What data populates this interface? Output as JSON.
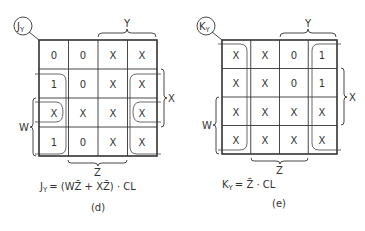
{
  "maps": [
    {
      "id": "d",
      "name_main": "J",
      "name_sub": "Y",
      "caption": "(d)",
      "equation": {
        "lhs_main": "J",
        "lhs_sub": "Y",
        "rhs": "= (WZ̄ + XZ̄) · CL"
      },
      "var_labels": {
        "top": "Y",
        "right": "X",
        "left": "W",
        "bottom": "Z"
      },
      "cells": [
        [
          "0",
          "0",
          "X",
          "X"
        ],
        [
          "1",
          "0",
          "X",
          "X"
        ],
        [
          "X",
          "X",
          "X",
          "X"
        ],
        [
          "1",
          "0",
          "X",
          "X"
        ]
      ],
      "groups": [
        "column 1 rows 2-4 (WZ̄)",
        "column 4 rows 2-4 (XZ̄ wrap)",
        "row 3 cols 1 and 4 (wrap)"
      ]
    },
    {
      "id": "e",
      "name_main": "K",
      "name_sub": "Y",
      "caption": "(e)",
      "equation": {
        "lhs_main": "K",
        "lhs_sub": "Y",
        "rhs": "= Z̄ · CL"
      },
      "var_labels": {
        "top": "Y",
        "right": "X",
        "left": "W",
        "bottom": "Z"
      },
      "cells": [
        [
          "X",
          "X",
          "0",
          "1"
        ],
        [
          "X",
          "X",
          "0",
          "1"
        ],
        [
          "X",
          "X",
          "X",
          "X"
        ],
        [
          "X",
          "X",
          "X",
          "X"
        ]
      ],
      "groups": [
        "column 1 + column 4 wrap (Z̄)"
      ]
    }
  ]
}
